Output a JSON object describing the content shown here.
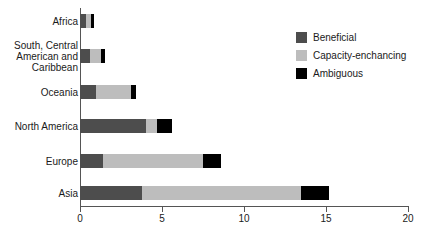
{
  "chart_data": {
    "type": "bar",
    "orientation": "horizontal",
    "stacked": true,
    "title": "",
    "xlabel": "",
    "ylabel": "",
    "xlim": [
      0,
      20
    ],
    "xticks": [
      0,
      5,
      10,
      15,
      20
    ],
    "xtick_labels": [
      "0",
      "5",
      "10",
      "15",
      "20"
    ],
    "grid": false,
    "legend_position": "top-right",
    "categories": [
      "Africa",
      "South, Central American and Caribbean",
      "Oceania",
      "North America",
      "Europe",
      "Asia"
    ],
    "series": [
      {
        "name": "Beneficial",
        "color": "#4d4d4d",
        "values": [
          0.35,
          0.6,
          1.0,
          4.0,
          1.4,
          3.8
        ]
      },
      {
        "name": "Capacity-enchancing",
        "color": "#bdbdbd",
        "values": [
          0.3,
          0.7,
          2.1,
          0.7,
          6.1,
          9.7
        ]
      },
      {
        "name": "Ambiguous",
        "color": "#000000",
        "values": [
          0.2,
          0.2,
          0.3,
          0.9,
          1.1,
          1.7
        ]
      }
    ],
    "totals": [
      0.85,
      1.5,
      3.4,
      5.6,
      8.6,
      15.2
    ]
  },
  "legend": {
    "items": [
      {
        "label": "Beneficial",
        "color": "#4d4d4d"
      },
      {
        "label": "Capacity-enchancing",
        "color": "#bdbdbd"
      },
      {
        "label": "Ambiguous",
        "color": "#000000"
      }
    ]
  },
  "axis": {
    "x_tick_labels": [
      "0",
      "5",
      "10",
      "15",
      "20"
    ]
  },
  "categories_display": [
    "Africa",
    "South, Central\nAmerican and\nCaribbean",
    "Oceania",
    "North America",
    "Europe",
    "Asia"
  ]
}
